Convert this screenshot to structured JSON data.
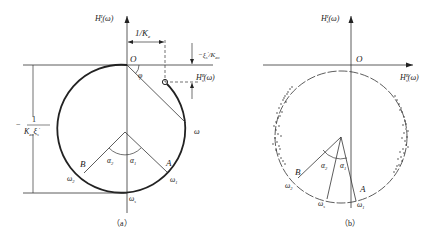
{
  "figure_a": {
    "caption": "（a）",
    "y_axis_label": "H",
    "y_axis_sup": "I",
    "y_axis_sub": "s",
    "y_axis_arg": "(ω)",
    "x_axis_label": "H",
    "x_axis_sup": "R",
    "x_axis_sub": "s",
    "x_axis_arg": "(ω)",
    "origin": "O",
    "angle_phi": "φ",
    "dim_top": "1/K",
    "dim_top_sub": "e",
    "dim_right": "−ξ",
    "dim_right_sub": "s",
    "dim_right_prime": "′",
    "dim_right_den": "/K",
    "dim_right_den_sub": "eo",
    "dim_left_num": "1",
    "dim_left_minus": "−",
    "dim_left_den": "K",
    "dim_left_den_sub": "eo",
    "dim_left_den2": "ξ",
    "dim_left_den2_sub": "s",
    "dim_left_den2_prime": "′",
    "omega": "ω",
    "point_a": "A",
    "point_b": "B",
    "alpha1": "α",
    "alpha1_sub": "1",
    "alpha2": "α",
    "alpha2_sub": "2",
    "omega1": "ω",
    "omega1_sub": "1",
    "omega2": "ω",
    "omega2_sub": "2",
    "omegas": "ω",
    "omegas_sub": "s"
  },
  "figure_b": {
    "caption": "（b）",
    "y_axis_label": "H",
    "y_axis_sup": "I",
    "y_axis_sub": "s",
    "y_axis_arg": "(ω)",
    "x_axis_label": "H",
    "x_axis_sup": "R",
    "x_axis_sub": "s",
    "x_axis_arg": "(ω)",
    "origin": "O",
    "point_a": "A",
    "point_b": "B",
    "alpha1": "α",
    "alpha1_sub": "1",
    "alpha2": "α",
    "alpha2_sub": "2",
    "omega1": "ω",
    "omega1_sub": "1",
    "omega2": "ω",
    "omega2_sub": "2",
    "omegas": "ω",
    "omegas_sub": "s"
  }
}
